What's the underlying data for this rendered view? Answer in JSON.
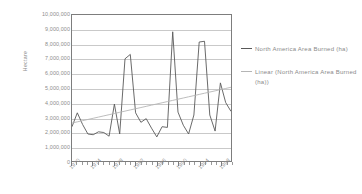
{
  "chart_data": {
    "type": "line",
    "title": "",
    "xlabel": "",
    "ylabel": "Hectare",
    "ylim": [
      0,
      10000000
    ],
    "xlim": [
      1970,
      2000
    ],
    "grid": true,
    "legend_position": "right",
    "y_ticks": [
      "10,000,000",
      "9,000,000",
      "8,000,000",
      "7,000,000",
      "6,000,000",
      "5,000,000",
      "4,000,000",
      "3,000,000",
      "2,000,000",
      "1,000,000",
      "0"
    ],
    "y_tick_values": [
      10000000,
      9000000,
      8000000,
      7000000,
      6000000,
      5000000,
      4000000,
      3000000,
      2000000,
      1000000,
      0
    ],
    "x_tick_labels": [
      "1970",
      "1974",
      "1978",
      "1982",
      "1986",
      "1990",
      "1994",
      "1998"
    ],
    "x_tick_values": [
      1970,
      1974,
      1978,
      1982,
      1986,
      1990,
      1994,
      1998
    ],
    "x": [
      1970,
      1971,
      1972,
      1973,
      1974,
      1975,
      1976,
      1977,
      1978,
      1979,
      1980,
      1981,
      1982,
      1983,
      1984,
      1985,
      1986,
      1987,
      1988,
      1989,
      1990,
      1991,
      1992,
      1993,
      1994,
      1995,
      1996,
      1997,
      1998,
      1999,
      2000
    ],
    "series": [
      {
        "name": "North America Area Burned (ha)",
        "color": "#595959",
        "type": "line",
        "values": [
          2350000,
          3300000,
          2500000,
          1850000,
          1800000,
          2000000,
          1950000,
          1700000,
          3900000,
          1850000,
          7000000,
          7300000,
          3300000,
          2650000,
          2900000,
          2250000,
          1650000,
          2350000,
          2300000,
          8850000,
          3350000,
          2450000,
          1850000,
          3150000,
          8150000,
          8200000,
          3150000,
          2050000,
          5350000,
          4000000,
          3400000
        ]
      },
      {
        "name": "Linear (North America Area Burned (ha))",
        "color": "#b5b5b5",
        "type": "trendline",
        "values": [
          2600000,
          2681667,
          2763333,
          2845000,
          2926667,
          3008333,
          3090000,
          3171667,
          3253333,
          3335000,
          3416667,
          3498333,
          3580000,
          3661667,
          3743333,
          3825000,
          3906667,
          3988333,
          4070000,
          4151667,
          4233333,
          4315000,
          4396667,
          4478333,
          4560000,
          4641667,
          4723333,
          4805000,
          4886667,
          4968333,
          5050000
        ]
      }
    ]
  },
  "legend": {
    "entries": [
      {
        "label": "North America Area Burned (ha)",
        "marker": "line-marker-dark"
      },
      {
        "label": "Linear (North America Area Burned (ha))",
        "marker": "line-marker-light"
      }
    ]
  },
  "colors": {
    "series_line": "#595959",
    "trend_line": "#b5b5b5",
    "gridline": "#c9c9c9",
    "axis": "#7d7d7d",
    "text": "#8a8a8a",
    "background": "#ffffff"
  }
}
